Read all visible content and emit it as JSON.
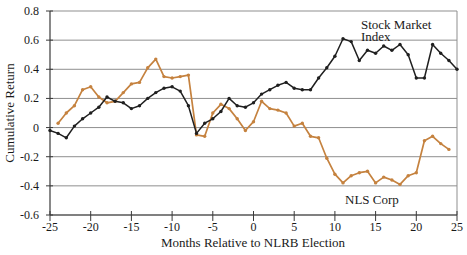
{
  "chart_data": {
    "type": "line",
    "title": "",
    "xlabel": "Months Relative to NLRB Election",
    "ylabel": "Cumulative Return",
    "xlim": [
      -25,
      25
    ],
    "ylim": [
      -0.6,
      0.8
    ],
    "x_ticks": [
      -25,
      -20,
      -15,
      -10,
      -5,
      0,
      5,
      10,
      15,
      20,
      25
    ],
    "y_ticks": [
      0.8,
      0.6,
      0.4,
      0.2,
      0,
      -0.2,
      -0.4,
      -0.6
    ],
    "y_tick_labels": [
      "0.8",
      "0.6",
      "0.4",
      "0.2",
      "0",
      "-0.2",
      "-0.4",
      "-0.6"
    ],
    "x_tick_labels": [
      "-25",
      "-20",
      "-15",
      "-10",
      "-5",
      "0",
      "5",
      "10",
      "15",
      "20",
      "25"
    ],
    "grid": "horizontal",
    "legend_position": "inline-annotations",
    "colors": {
      "gridline": "#8f8f8f",
      "axis": "#3a3a3a",
      "background": "#ffffff"
    },
    "series": [
      {
        "name": "Stock Market Index",
        "color": "#1f1f1f",
        "marker": "dot",
        "x": [
          -25,
          -24,
          -23,
          -22,
          -21,
          -20,
          -19,
          -18,
          -17,
          -16,
          -15,
          -14,
          -13,
          -12,
          -11,
          -10,
          -9,
          -8,
          -7,
          -6,
          -5,
          -4,
          -3,
          -2,
          -1,
          0,
          1,
          2,
          3,
          4,
          5,
          6,
          7,
          8,
          9,
          10,
          11,
          12,
          13,
          14,
          15,
          16,
          17,
          18,
          19,
          20,
          21,
          22,
          23,
          24,
          25
        ],
        "values": [
          -0.02,
          -0.04,
          -0.07,
          0.01,
          0.06,
          0.1,
          0.14,
          0.21,
          0.18,
          0.17,
          0.13,
          0.15,
          0.2,
          0.24,
          0.27,
          0.28,
          0.25,
          0.15,
          -0.04,
          0.03,
          0.06,
          0.11,
          0.2,
          0.15,
          0.14,
          0.17,
          0.23,
          0.26,
          0.29,
          0.31,
          0.27,
          0.26,
          0.26,
          0.34,
          0.41,
          0.49,
          0.61,
          0.59,
          0.46,
          0.53,
          0.51,
          0.56,
          0.53,
          0.57,
          0.5,
          0.34,
          0.34,
          0.57,
          0.51,
          0.46,
          0.4
        ],
        "annotation": {
          "lines": [
            "Stock Market",
            "Index"
          ],
          "anchor": {
            "month": 13.2,
            "value": 0.745
          }
        }
      },
      {
        "name": "NLS Corp",
        "color": "#c5823f",
        "marker": "dot",
        "x": [
          -24,
          -23,
          -22,
          -21,
          -20,
          -19,
          -18,
          -17,
          -16,
          -15,
          -14,
          -13,
          -12,
          -11,
          -10,
          -9,
          -8,
          -7,
          -6,
          -5,
          -4,
          -3,
          -2,
          -1,
          0,
          1,
          2,
          3,
          4,
          5,
          6,
          7,
          8,
          9,
          10,
          11,
          12,
          13,
          14,
          15,
          16,
          17,
          18,
          19,
          20,
          21,
          22,
          23,
          24
        ],
        "values": [
          0.03,
          0.1,
          0.15,
          0.26,
          0.28,
          0.21,
          0.17,
          0.18,
          0.24,
          0.3,
          0.31,
          0.41,
          0.47,
          0.35,
          0.34,
          0.35,
          0.36,
          -0.05,
          -0.06,
          0.1,
          0.16,
          0.13,
          0.06,
          -0.02,
          0.04,
          0.18,
          0.13,
          0.12,
          0.1,
          0.01,
          0.03,
          -0.06,
          -0.07,
          -0.21,
          -0.32,
          -0.38,
          -0.33,
          -0.31,
          -0.3,
          -0.38,
          -0.34,
          -0.36,
          -0.39,
          -0.33,
          -0.31,
          -0.09,
          -0.06,
          -0.11,
          -0.15
        ],
        "annotation": {
          "lines": [
            "NLS Corp"
          ],
          "anchor": {
            "month": 11.25,
            "value": -0.456
          }
        }
      }
    ]
  }
}
